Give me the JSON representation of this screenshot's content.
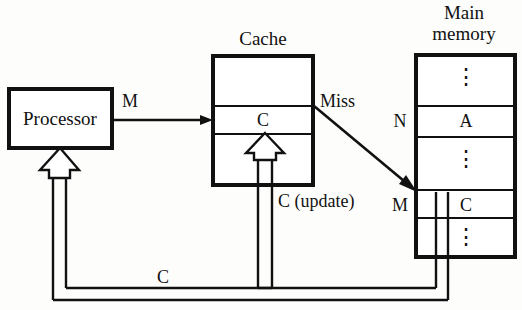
{
  "diagram": {
    "type": "block-diagram"
  },
  "blocks": {
    "processor": {
      "label": "Processor"
    },
    "cache": {
      "title": "Cache",
      "cells": [
        {
          "text": ""
        },
        {
          "text": "C"
        },
        {
          "text": ""
        }
      ]
    },
    "main_memory": {
      "title_line1": "Main",
      "title_line2": "memory",
      "cells": [
        {
          "text": "⋮",
          "addr": ""
        },
        {
          "text": "A",
          "addr": "N"
        },
        {
          "text": "⋮",
          "addr": ""
        },
        {
          "text": "C",
          "addr": "M"
        },
        {
          "text": "⋮",
          "addr": ""
        }
      ]
    }
  },
  "signals": {
    "proc_to_cache": "M",
    "cache_miss": "Miss",
    "cache_update": "C (update)",
    "return_c": "C",
    "addr_n": "N",
    "addr_m": "M"
  },
  "colors": {
    "stroke": "#111111",
    "background": "#fdfdfc",
    "fill": "#ffffff"
  }
}
